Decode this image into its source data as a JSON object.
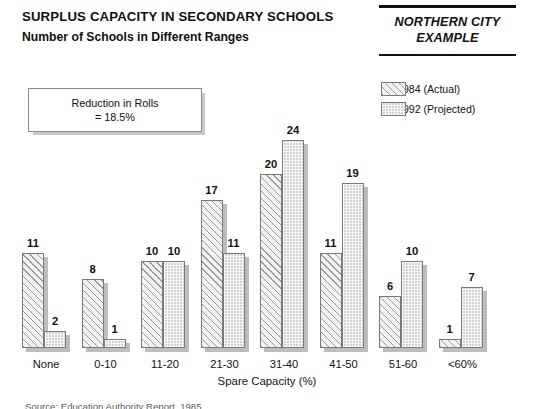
{
  "header": {
    "title": "SURPLUS CAPACITY IN SECONDARY SCHOOLS",
    "subtitle": "Number of Schools in Different Ranges",
    "badge_line1": "NORTHERN CITY",
    "badge_line2": "EXAMPLE"
  },
  "note_box": {
    "line1": "Reduction in Rolls",
    "line2": "= 18.5%"
  },
  "legend": {
    "items": [
      {
        "label": "1984  (Actual)",
        "swatch": "hatched-swatch"
      },
      {
        "label": "1992  (Projected)",
        "swatch": "stippled-swatch"
      }
    ]
  },
  "source_note": "Source: Education Authority Report, 1985",
  "colors": {
    "ink": "#111111",
    "bar_outline": "#7a7a7a",
    "actual_fill": "#f2f2f2",
    "actual_hatch": "#9a9a9a",
    "projected_fill": "#d2d2d2",
    "shadow": "#bdbdbd"
  },
  "chart_data": {
    "type": "bar",
    "title": "SURPLUS CAPACITY IN SECONDARY SCHOOLS",
    "subtitle": "Number of Schools in Different Ranges",
    "xlabel": "Spare Capacity (%)",
    "ylabel": "",
    "categories": [
      "None",
      "0-10",
      "11-20",
      "21-30",
      "31-40",
      "41-50",
      "51-60",
      "<60%"
    ],
    "series": [
      {
        "name": "1984  (Actual)",
        "values": [
          11,
          8,
          10,
          17,
          20,
          11,
          6,
          1
        ]
      },
      {
        "name": "1992  (Projected)",
        "values": [
          2,
          1,
          10,
          11,
          24,
          19,
          10,
          7
        ]
      }
    ],
    "ylim": [
      0,
      24
    ],
    "grid": false,
    "legend_position": "top-right",
    "data_labels": true,
    "annotations": [
      "Reduction in Rolls = 18.5%",
      "NORTHERN CITY EXAMPLE"
    ]
  }
}
